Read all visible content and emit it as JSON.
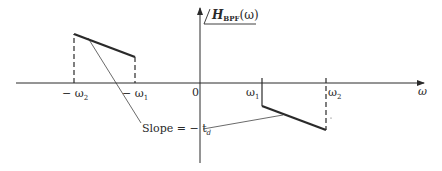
{
  "diagram": {
    "type": "bandpass-filter-phase-response",
    "title": {
      "symbol": "H",
      "subscript": "BPF",
      "argument": "(ω)"
    },
    "axes": {
      "x_label": "ω",
      "origin_label": "0"
    },
    "tick_labels": {
      "neg_omega2": "− ω",
      "neg_omega2_sub": "2",
      "neg_omega1": "− ω",
      "neg_omega1_sub": "1",
      "omega1": "ω",
      "omega1_sub": "1",
      "omega2": "ω",
      "omega2_sub": "2"
    },
    "annotation": {
      "slope_text": "Slope = − t",
      "slope_sub": "d"
    },
    "colors": {
      "line": "#2a2a2a",
      "background": "#ffffff"
    }
  }
}
